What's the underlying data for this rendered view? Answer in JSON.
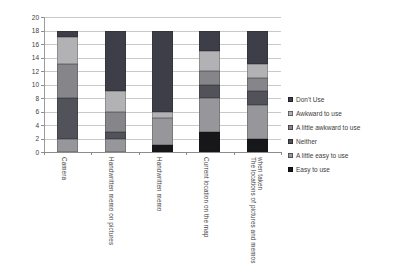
{
  "chart_data": {
    "type": "bar",
    "stacked": true,
    "title": "",
    "xlabel": "",
    "ylabel": "",
    "ylim": [
      0,
      20
    ],
    "ytick_step": 2,
    "yticks": [
      "0",
      "2",
      "4",
      "6",
      "8",
      "10",
      "12",
      "14",
      "16",
      "18",
      "20"
    ],
    "grid": true,
    "legend_position": "right",
    "categories": [
      "Camera",
      "Handwritten memo on pictures",
      "Handwritten memo",
      "Current location on the map",
      "The locations of pictures and memos when taken"
    ],
    "series": [
      {
        "name": "Don't Use",
        "color": "#3e3e48",
        "values": [
          1,
          9,
          12,
          3,
          5
        ]
      },
      {
        "name": "Awkward to use",
        "color": "#b2b2b5",
        "values": [
          4,
          3,
          1,
          3,
          2
        ]
      },
      {
        "name": "A little awkward to use",
        "color": "#85858a",
        "values": [
          5,
          3,
          0,
          2,
          2
        ]
      },
      {
        "name": "Neither",
        "color": "#52525a",
        "values": [
          6,
          1,
          0,
          2,
          2
        ]
      },
      {
        "name": "A little easy to use",
        "color": "#97979b",
        "values": [
          2,
          2,
          4,
          5,
          5
        ]
      },
      {
        "name": "Easy to use",
        "color": "#17171a",
        "values": [
          0,
          0,
          1,
          3,
          2
        ]
      }
    ],
    "stack_order_bottom_to_top": [
      "Easy to use",
      "A little easy to use",
      "Neither",
      "A little awkward to use",
      "Awkward to use",
      "Don't Use"
    ]
  }
}
